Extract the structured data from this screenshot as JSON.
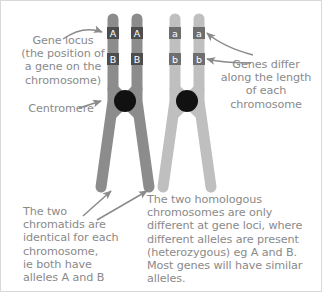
{
  "diagram": {
    "background_color": "#ffffff",
    "border_color": "#d8d8d8",
    "text_color": "#8a8a8a",
    "centromere_color": "#111111",
    "chromosome_left_color": "#8c8c8c",
    "chromosome_right_color": "#bfbfbf",
    "allele_box_left_color": "#4d4d4d",
    "allele_box_right_color": "#6e6e6e",
    "arrow_color": "#8a8a8a"
  },
  "captions": {
    "gene_locus": "Gene locus\n(the position of\na gene on the\nchromosome)",
    "centromere": "Centromere",
    "genes_differ": "Genes differ\nalong the length\nof each\nchromosome",
    "chromatids": "The two\nchromatids are\nidentical for each\nchromosome,\nie both have\nalleles A and B",
    "homologous": "The two homologous\nchromosomes are only\ndifferent at gene loci, where\ndifferent alleles are present\n(heterozygous) eg A and B.\nMost genes will have similar\nalleles."
  },
  "chromosomes": [
    {
      "name": "chromosome-left",
      "shade": "dark",
      "chromatids": [
        {
          "name": "chromatid-left-outer",
          "alleles": [
            "A",
            "B"
          ]
        },
        {
          "name": "chromatid-left-inner",
          "alleles": [
            "A",
            "B"
          ]
        }
      ]
    },
    {
      "name": "chromosome-right",
      "shade": "light",
      "chromatids": [
        {
          "name": "chromatid-right-inner",
          "alleles": [
            "a",
            "b"
          ]
        },
        {
          "name": "chromatid-right-outer",
          "alleles": [
            "a",
            "b"
          ]
        }
      ]
    }
  ],
  "alleles": {
    "left_outer_top": "A",
    "left_outer_bottom": "B",
    "left_inner_top": "A",
    "left_inner_bottom": "B",
    "right_inner_top": "a",
    "right_inner_bottom": "b",
    "right_outer_top": "a",
    "right_outer_bottom": "b"
  },
  "annotations": {
    "arrow_gene_locus": "curved-arrow-to-allele-A",
    "arrow_centromere": "straight-arrow-to-centromere",
    "arrow_genes_differ_top": "curved-arrow-to-allele-a",
    "arrow_genes_differ_bottom": "curved-arrow-to-allele-b",
    "arrow_chromatid_left": "straight-arrow-to-chromatid-1",
    "arrow_chromatid_right": "straight-arrow-to-chromatid-2"
  }
}
